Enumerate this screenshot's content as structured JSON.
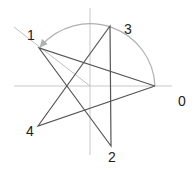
{
  "diagram": {
    "colors": {
      "axis": "#c8c8c8",
      "arc": "#b0b0b0",
      "guide": "#c0c0c0",
      "star": "#555555",
      "label": "#222222"
    },
    "center": {
      "x": 90,
      "y": 86
    },
    "axes": {
      "horizontal": {
        "x1": 14,
        "y1": 86,
        "x2": 172,
        "y2": 86
      },
      "vertical": {
        "x1": 90,
        "y1": 8,
        "x2": 90,
        "y2": 155
      }
    },
    "points": [
      {
        "id": "0",
        "label": "0",
        "x": 155,
        "y": 86,
        "label_x": 178,
        "label_y": 106
      },
      {
        "id": "1",
        "label": "1",
        "x": 39,
        "y": 48,
        "label_x": 27,
        "label_y": 40
      },
      {
        "id": "2",
        "label": "2",
        "x": 111,
        "y": 146,
        "label_x": 108,
        "label_y": 162
      },
      {
        "id": "3",
        "label": "3",
        "x": 110,
        "y": 26,
        "label_x": 124,
        "label_y": 34
      },
      {
        "id": "4",
        "label": "4",
        "x": 38,
        "y": 126,
        "label_x": 26,
        "label_y": 136
      }
    ],
    "star_order": [
      "0",
      "1",
      "2",
      "3",
      "4",
      "0"
    ],
    "arc": {
      "from": "0",
      "to": "1",
      "radius": 65,
      "direction": "counterclockwise",
      "arrow_at": "1"
    },
    "guide_line": {
      "x1": 14,
      "y1": 27,
      "x2": 90,
      "y2": 86
    }
  }
}
